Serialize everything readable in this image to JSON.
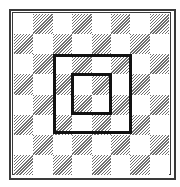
{
  "diagram": {
    "type": "checkerboard-with-nested-squares",
    "rows": 8,
    "cols": 8,
    "top_left_cell": "white",
    "colors": {
      "frame": "#3a3a3a",
      "hatch": "#6e6e6e",
      "light": "#ffffff",
      "square_outline": "#111111"
    },
    "squares": [
      {
        "name": "outer-square",
        "col_start": 2,
        "row_start": 2,
        "span": 4,
        "left": 53,
        "top": 54,
        "width": 79,
        "height": 80,
        "thickness": 3
      },
      {
        "name": "inner-square",
        "col_start": 3,
        "row_start": 3,
        "span": 2,
        "left": 71,
        "top": 73,
        "width": 41,
        "height": 42,
        "thickness": 3
      }
    ]
  }
}
